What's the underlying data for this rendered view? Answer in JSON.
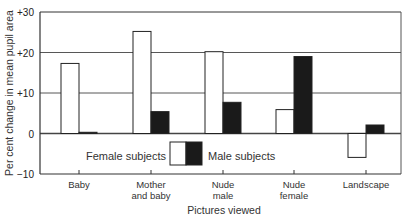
{
  "chart_data": {
    "type": "bar",
    "title": "",
    "xlabel": "Pictures viewed",
    "ylabel": "Per cent change in mean pupil area",
    "categories": [
      "Baby",
      "Mother and baby",
      "Nude male",
      "Nude female",
      "Landscape"
    ],
    "category_lines": [
      [
        "Baby"
      ],
      [
        "Mother",
        "and baby"
      ],
      [
        "Nude",
        "male"
      ],
      [
        "Nude",
        "female"
      ],
      [
        "Landscape"
      ]
    ],
    "series": [
      {
        "name": "Female subjects",
        "fill": "#ffffff",
        "values": [
          17.3,
          25.2,
          20.2,
          5.9,
          -5.9
        ]
      },
      {
        "name": "Male subjects",
        "fill": "#1a1a1a",
        "values": [
          0.3,
          5.4,
          7.7,
          19.0,
          2.1
        ]
      }
    ],
    "ylim": [
      -10,
      30
    ],
    "yticks": [
      30,
      20,
      10,
      0,
      -10
    ],
    "ytick_labels": [
      "+30",
      "+20",
      "+10",
      "0",
      "−10"
    ],
    "grid": true,
    "gridlines_at": [
      20,
      10,
      0
    ],
    "legend_position": "inside-bottom-center"
  },
  "legend": {
    "female_label": "Female subjects",
    "male_label": "Male subjects"
  },
  "axes": {
    "x_title": "Pictures viewed",
    "y_title": "Per cent change in mean pupil area"
  }
}
